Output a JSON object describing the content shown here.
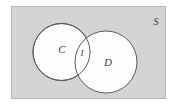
{
  "figure": {
    "type": "venn-diagram",
    "title": "",
    "universe_label": "S",
    "sets": [
      {
        "id": "C",
        "label": "C"
      },
      {
        "id": "D",
        "label": "D"
      }
    ],
    "regions": [
      {
        "id": "I",
        "label": "I",
        "meaning": "intersection"
      }
    ],
    "colors": {
      "universe_fill": "#d4d4d4",
      "universe_stroke": "#b8b8b8",
      "circle_fill": "#fdfdfd",
      "circle_stroke": "#5a5a5a",
      "label_color": "#3a3a3a",
      "page_background": "#ffffff"
    },
    "geometry": {
      "universe_rect": {
        "x": 11,
        "y": 6,
        "width": 155,
        "height": 93
      },
      "circle_c": {
        "cx": 61.5,
        "cy": 52,
        "r": 28.5
      },
      "circle_d": {
        "cx": 106,
        "cy": 62,
        "r": 31
      },
      "label_c_pos": {
        "x": 62,
        "y": 50
      },
      "label_d_pos": {
        "x": 108,
        "y": 63
      },
      "label_i_pos": {
        "x": 82,
        "y": 54
      },
      "label_s_pos": {
        "x": 156,
        "y": 23
      }
    }
  }
}
